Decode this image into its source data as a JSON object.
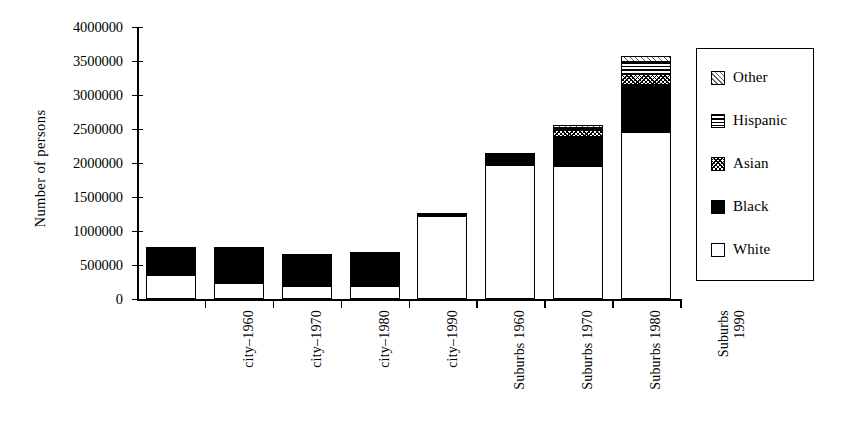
{
  "chart_data": {
    "type": "bar",
    "subtype": "stacked-bar",
    "title": "",
    "xlabel": "",
    "ylabel": "Number of persons",
    "ylim": [
      0,
      4000000
    ],
    "ytick_step": 500000,
    "ytick_labels": [
      "0",
      "500000",
      "1000000",
      "1500000",
      "2000000",
      "2500000",
      "3000000",
      "3500000",
      "4000000"
    ],
    "ytick_values": [
      0,
      500000,
      1000000,
      1500000,
      2000000,
      2500000,
      3000000,
      3500000,
      4000000
    ],
    "grid": false,
    "legend_position": "right-outside",
    "categories": [
      "city–1960",
      "city–1970",
      "city–1980",
      "city–1990",
      "Suburbs 1960",
      "Suburbs 1970",
      "Suburbs 1980",
      "Suburbs\n1990"
    ],
    "series": [
      {
        "name": "White",
        "pattern": "white",
        "values": [
          360000,
          230000,
          195000,
          185000,
          1220000,
          1975000,
          1950000,
          2460000
        ]
      },
      {
        "name": "Black",
        "pattern": "black",
        "values": [
          410000,
          540000,
          460000,
          445000,
          50000,
          165000,
          430000,
          690000
        ]
      },
      {
        "name": "Asian",
        "pattern": "asian",
        "values": [
          0,
          0,
          0,
          20000,
          0,
          0,
          100000,
          160000
        ]
      },
      {
        "name": "Hispanic",
        "pattern": "hispanic",
        "values": [
          0,
          0,
          0,
          10000,
          0,
          0,
          35000,
          180000
        ]
      },
      {
        "name": "Other",
        "pattern": "other",
        "values": [
          0,
          0,
          0,
          0,
          0,
          0,
          40000,
          80000
        ]
      }
    ],
    "totals": [
      770000,
      770000,
      655000,
      660000,
      1270000,
      2140000,
      2555000,
      3570000
    ]
  },
  "legend": {
    "items": [
      {
        "label": "Other",
        "pattern": "other"
      },
      {
        "label": "Hispanic",
        "pattern": "hispanic"
      },
      {
        "label": "Asian",
        "pattern": "asian"
      },
      {
        "label": "Black",
        "pattern": "black"
      },
      {
        "label": "White",
        "pattern": "white"
      }
    ]
  },
  "colors": {
    "ink": "#000000",
    "background": "#ffffff"
  }
}
